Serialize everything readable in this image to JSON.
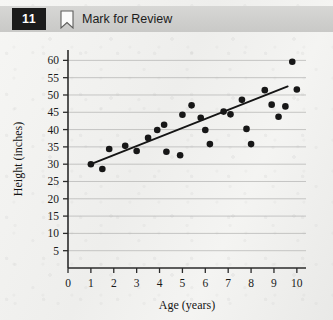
{
  "header": {
    "question_number": "11",
    "mark_label": "Mark for Review",
    "badge_bg": "#1b1b1b",
    "bar_bg": "#d2d2d0",
    "bookmark_icon": "bookmark-outline-icon"
  },
  "chart_data": {
    "type": "scatter",
    "title": "",
    "xlabel": "Age (years)",
    "ylabel": "Height (inches)",
    "xlim": [
      0,
      10.4
    ],
    "ylim": [
      0,
      63
    ],
    "xticks": [
      0,
      1,
      2,
      3,
      4,
      5,
      6,
      7,
      8,
      9,
      10
    ],
    "xticklabels": [
      "0",
      "1",
      "2",
      "3",
      "4",
      "5",
      "6",
      "7",
      "8",
      "9",
      "10"
    ],
    "yticks": [
      5,
      10,
      15,
      20,
      25,
      30,
      35,
      40,
      45,
      50,
      55,
      60
    ],
    "yticklabels": [
      "5",
      "10",
      "15",
      "20",
      "25",
      "30",
      "35",
      "40",
      "45",
      "50",
      "55",
      "60"
    ],
    "grid": true,
    "grid_axis": "y",
    "legend": "none",
    "marker_color": "#171717",
    "points": [
      {
        "x": 1.0,
        "y": 30.0
      },
      {
        "x": 1.5,
        "y": 28.6
      },
      {
        "x": 1.8,
        "y": 34.4
      },
      {
        "x": 2.5,
        "y": 35.3
      },
      {
        "x": 3.0,
        "y": 33.8
      },
      {
        "x": 3.5,
        "y": 37.6
      },
      {
        "x": 3.9,
        "y": 39.9
      },
      {
        "x": 4.2,
        "y": 41.4
      },
      {
        "x": 4.3,
        "y": 33.6
      },
      {
        "x": 4.9,
        "y": 32.6
      },
      {
        "x": 5.0,
        "y": 44.3
      },
      {
        "x": 5.4,
        "y": 47.0
      },
      {
        "x": 5.8,
        "y": 43.4
      },
      {
        "x": 6.0,
        "y": 39.9
      },
      {
        "x": 6.2,
        "y": 35.8
      },
      {
        "x": 6.8,
        "y": 45.2
      },
      {
        "x": 7.1,
        "y": 44.4
      },
      {
        "x": 7.6,
        "y": 48.6
      },
      {
        "x": 7.8,
        "y": 40.2
      },
      {
        "x": 8.0,
        "y": 35.8
      },
      {
        "x": 8.6,
        "y": 51.4
      },
      {
        "x": 8.9,
        "y": 47.2
      },
      {
        "x": 9.2,
        "y": 43.7
      },
      {
        "x": 9.5,
        "y": 46.7
      },
      {
        "x": 9.8,
        "y": 59.6
      },
      {
        "x": 10.0,
        "y": 51.6
      }
    ],
    "trendline": {
      "x0": 1.0,
      "y0": 30.0,
      "x1": 9.6,
      "y1": 52.5,
      "color": "#151515"
    }
  }
}
